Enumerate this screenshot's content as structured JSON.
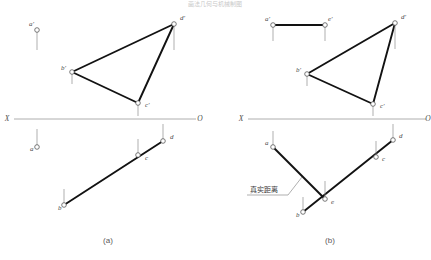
{
  "title": "画法几何与机械制图",
  "figure": {
    "width": 431,
    "height": 260,
    "background": "#ffffff",
    "line_color": "#121212",
    "thin_color": "#8e8e8e",
    "axis_color": "#9a9a9a",
    "label_color": "#4a4a4a"
  },
  "panels": [
    {
      "id": "panel-a",
      "caption": "(a)",
      "caption_x": 108,
      "caption_y": 243,
      "axis": {
        "left_label": "X",
        "right_label": "O",
        "x1": 14,
        "x2": 196,
        "y": 119,
        "left_label_x": 7,
        "right_label_x": 200,
        "label_y": 121
      },
      "points": [
        {
          "name": "a-prime",
          "label": "a'",
          "x": 37,
          "y": 30,
          "lx": 29,
          "ly": 26,
          "tick": "down",
          "tick_len": 20
        },
        {
          "name": "b-prime",
          "label": "b'",
          "x": 72,
          "y": 72,
          "lx": 61,
          "ly": 70,
          "tick": "down",
          "tick_len": 12
        },
        {
          "name": "c-prime",
          "label": "c'",
          "x": 138,
          "y": 103,
          "lx": 145,
          "ly": 107,
          "tick": "down",
          "tick_len": 13
        },
        {
          "name": "d-prime",
          "label": "d'",
          "x": 174,
          "y": 24,
          "lx": 180,
          "ly": 20,
          "tick": "down",
          "tick_len": 26
        },
        {
          "name": "a-point",
          "label": "a",
          "x": 37,
          "y": 147,
          "lx": 30,
          "ly": 151,
          "tick": "up",
          "tick_len": 18
        },
        {
          "name": "b-point",
          "label": "b",
          "x": 64,
          "y": 205,
          "lx": 58,
          "ly": 210,
          "tick": "up",
          "tick_len": 16
        },
        {
          "name": "c-point",
          "label": "c",
          "x": 138,
          "y": 155,
          "lx": 145,
          "ly": 160,
          "tick": "up",
          "tick_len": 16
        },
        {
          "name": "d-point",
          "label": "d",
          "x": 163,
          "y": 141,
          "lx": 170,
          "ly": 139,
          "tick": "up",
          "tick_len": 17
        }
      ],
      "thick_paths": [
        {
          "name": "edge-b-prime-d-prime",
          "d": "M 72,72 L 174,24"
        },
        {
          "name": "edge-d-prime-c-prime",
          "d": "M 174,24 L 138,103"
        },
        {
          "name": "edge-c-prime-b-prime",
          "d": "M 138,103 L 72,72"
        },
        {
          "name": "edge-b-d-plan",
          "d": "M 64,205 L 163,141"
        }
      ],
      "annotations": []
    },
    {
      "id": "panel-b",
      "caption": "(b)",
      "caption_x": 330,
      "caption_y": 243,
      "axis": {
        "left_label": "X",
        "right_label": "O",
        "x1": 248,
        "x2": 426,
        "y": 119,
        "left_label_x": 241,
        "right_label_x": 428,
        "label_y": 121
      },
      "points": [
        {
          "name": "a-prime",
          "label": "a'",
          "x": 273,
          "y": 25,
          "lx": 265,
          "ly": 21,
          "tick": "down",
          "tick_len": 16
        },
        {
          "name": "e-prime",
          "label": "e'",
          "x": 325,
          "y": 25,
          "lx": 328,
          "ly": 21,
          "tick": "down",
          "tick_len": 16
        },
        {
          "name": "b-prime",
          "label": "b'",
          "x": 307,
          "y": 74,
          "lx": 296,
          "ly": 72,
          "tick": "down",
          "tick_len": 12
        },
        {
          "name": "c-prime",
          "label": "c'",
          "x": 373,
          "y": 104,
          "lx": 380,
          "ly": 108,
          "tick": "down",
          "tick_len": 12
        },
        {
          "name": "d-prime",
          "label": "d'",
          "x": 395,
          "y": 23,
          "lx": 401,
          "ly": 19,
          "tick": "down",
          "tick_len": 26
        },
        {
          "name": "a-point",
          "label": "a",
          "x": 273,
          "y": 147,
          "lx": 265,
          "ly": 145,
          "tick": "up",
          "tick_len": 16
        },
        {
          "name": "e-point",
          "label": "e",
          "x": 325,
          "y": 199,
          "lx": 331,
          "ly": 204,
          "tick": "up",
          "tick_len": 18
        },
        {
          "name": "b-point",
          "label": "b",
          "x": 303,
          "y": 212,
          "lx": 296,
          "ly": 217,
          "tick": "up",
          "tick_len": 15
        },
        {
          "name": "c-point",
          "label": "c",
          "x": 376,
          "y": 157,
          "lx": 382,
          "ly": 161,
          "tick": "up",
          "tick_len": 16
        },
        {
          "name": "d-point",
          "label": "d",
          "x": 393,
          "y": 140,
          "lx": 399,
          "ly": 138,
          "tick": "up",
          "tick_len": 16
        }
      ],
      "thick_paths": [
        {
          "name": "edge-a-prime-e-prime",
          "d": "M 273,25 L 325,25"
        },
        {
          "name": "edge-b-prime-d-prime",
          "d": "M 307,74 L 395,23"
        },
        {
          "name": "edge-d-prime-c-prime",
          "d": "M 395,23 L 373,104"
        },
        {
          "name": "edge-c-prime-b-prime",
          "d": "M 373,104 L 307,74"
        },
        {
          "name": "edge-a-e-plan",
          "d": "M 273,147 L 325,199"
        },
        {
          "name": "edge-b-d-plan",
          "d": "M 303,212 L 393,140"
        }
      ],
      "annotations": [
        {
          "name": "true-distance-note",
          "text": "真实距离",
          "text_x": 250,
          "text_y": 192,
          "underline": "M 247,195 L 288,195",
          "leader": "M 288,195 L 302,177"
        }
      ]
    }
  ]
}
